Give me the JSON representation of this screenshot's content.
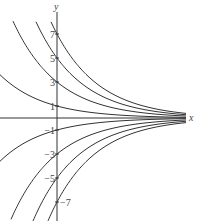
{
  "chart_data": {
    "type": "line",
    "title": "",
    "xlabel": "x",
    "ylabel": "y",
    "y_tick_labels": [
      "7",
      "5",
      "3",
      "1",
      "-1",
      "-3",
      "-5",
      "-7"
    ],
    "y_ticks": [
      7,
      5,
      3,
      1,
      -1,
      -3,
      -5,
      -7
    ],
    "decay_rate": 0.27,
    "series": [
      {
        "name": "C=7",
        "C": 7
      },
      {
        "name": "C=5",
        "C": 5
      },
      {
        "name": "C=3",
        "C": 3
      },
      {
        "name": "C=1",
        "C": 1
      },
      {
        "name": "C=-1",
        "C": -1
      },
      {
        "name": "C=-3",
        "C": -3
      },
      {
        "name": "C=-5",
        "C": -5
      },
      {
        "name": "C=-7",
        "C": -7
      }
    ],
    "xlim": [
      -4.75,
      10.75
    ],
    "ylim": [
      -8.4,
      8.4
    ],
    "grid": false,
    "legend": "none",
    "colors": {
      "curve": "#333333",
      "axis": "#333333"
    }
  }
}
